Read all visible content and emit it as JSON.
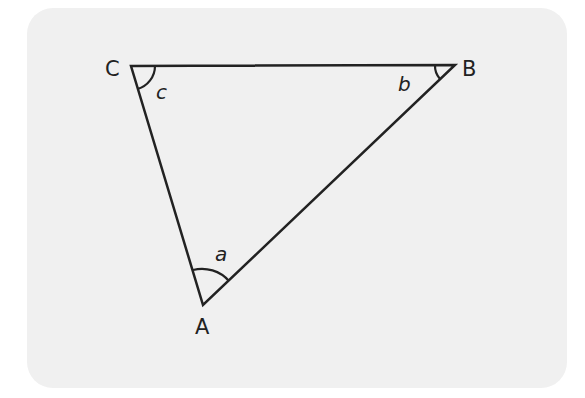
{
  "diagram": {
    "type": "triangle",
    "vertices": [
      {
        "id": "A",
        "label": "A",
        "x": 203,
        "y": 305
      },
      {
        "id": "B",
        "label": "B",
        "x": 455,
        "y": 65
      },
      {
        "id": "C",
        "label": "C",
        "x": 131,
        "y": 66
      }
    ],
    "angles": [
      {
        "vertex": "A",
        "label": "a"
      },
      {
        "vertex": "B",
        "label": "b"
      },
      {
        "vertex": "C",
        "label": "c"
      }
    ],
    "colors": {
      "background": "#f0f0f0",
      "stroke": "#222222"
    }
  }
}
